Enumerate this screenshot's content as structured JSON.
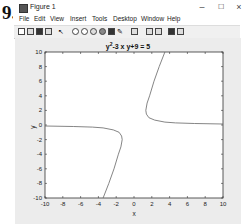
{
  "question_number": "9.",
  "window": {
    "title": "Figure 1",
    "controls": {
      "minimize": "–",
      "maximize": "☐",
      "close": "×"
    }
  },
  "menubar": {
    "items": [
      "File",
      "Edit",
      "View",
      "Insert",
      "Tools",
      "Desktop",
      "Window",
      "Help"
    ]
  },
  "toolbar": {
    "icons": [
      "new-figure-icon",
      "open-file-icon",
      "save-icon",
      "print-icon",
      "edit-plot-arrow-icon",
      "zoom-in-icon",
      "zoom-out-icon",
      "pan-icon",
      "rotate-3d-icon",
      "data-cursor-icon",
      "brush-icon",
      "link-plot-icon",
      "colorbar-icon",
      "legend-icon",
      "hide-plot-tools-icon",
      "show-plot-tools-icon"
    ]
  },
  "plot": {
    "title_base": "y",
    "title_sup": "2",
    "title_rest": "-3 x y+9 = 5"
  },
  "chart_data": {
    "type": "line",
    "xlabel": "x",
    "ylabel": "y",
    "xlim": [
      -10,
      10
    ],
    "ylim": [
      -10,
      10
    ],
    "xticks": [
      -10,
      -8,
      -6,
      -4,
      -2,
      0,
      2,
      4,
      6,
      8,
      10
    ],
    "yticks": [
      -10,
      -8,
      -6,
      -4,
      -2,
      0,
      2,
      4,
      6,
      8,
      10
    ],
    "grid": false,
    "series": [
      {
        "name": "upper branch",
        "x": [
          3.47,
          2.83,
          2.25,
          1.75,
          1.47,
          1.33,
          1.39,
          1.67,
          2.33,
          3.47,
          4.67,
          6.81,
          10.0
        ],
        "y": [
          10,
          8,
          6,
          4,
          3,
          2,
          1.5,
          1.0,
          0.67,
          0.4,
          0.29,
          0.2,
          0.133
        ]
      },
      {
        "name": "lower branch",
        "x": [
          -3.47,
          -2.83,
          -2.25,
          -1.75,
          -1.47,
          -1.33,
          -1.39,
          -1.67,
          -2.33,
          -3.47,
          -4.67,
          -6.81,
          -10.0
        ],
        "y": [
          -10,
          -8,
          -6,
          -4,
          -3,
          -2,
          -1.5,
          -1.0,
          -0.67,
          -0.4,
          -0.29,
          -0.2,
          -0.133
        ]
      }
    ]
  }
}
